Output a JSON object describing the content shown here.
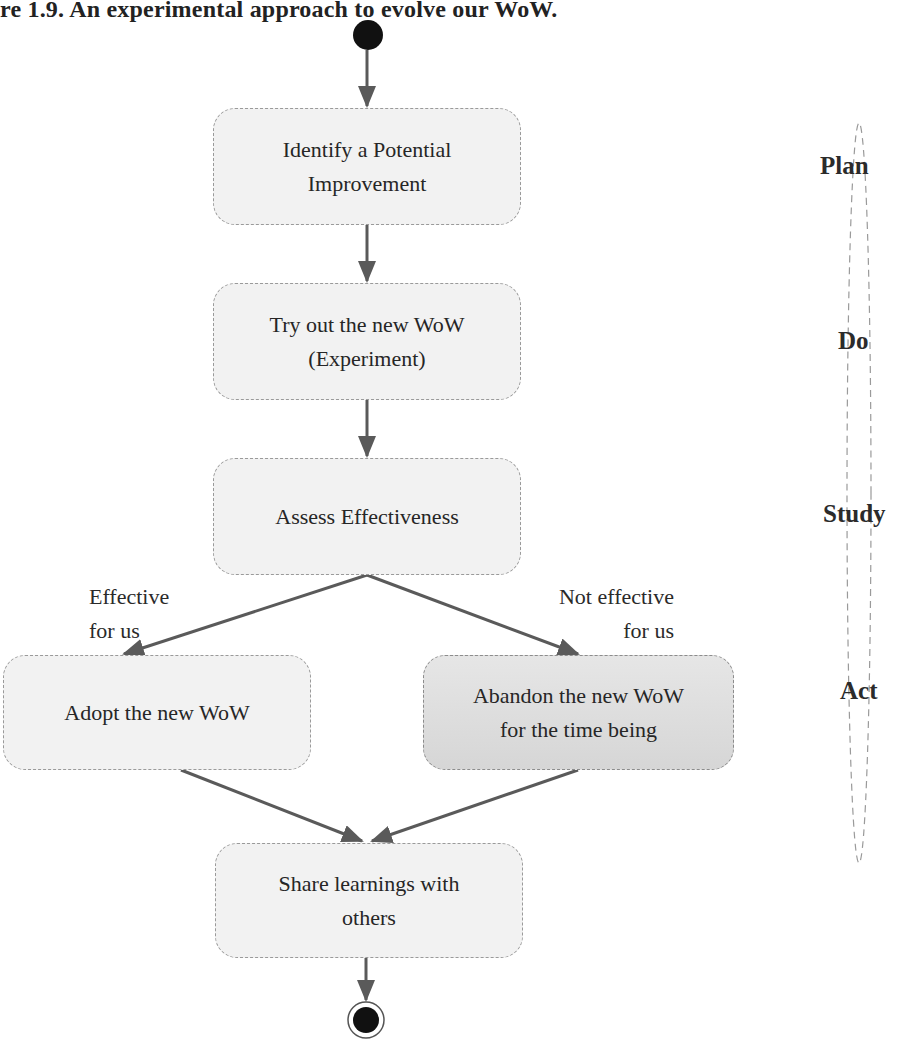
{
  "figure": {
    "title": "re 1.9. An experimental approach to evolve our WoW."
  },
  "nodes": [
    {
      "id": "identify",
      "label": "Identify a Potential\nImprovement"
    },
    {
      "id": "try",
      "label": "Try out the new WoW\n(Experiment)"
    },
    {
      "id": "assess",
      "label": "Assess Effectiveness"
    },
    {
      "id": "adopt",
      "label": "Adopt the new WoW"
    },
    {
      "id": "abandon",
      "label": "Abandon the new WoW\nfor the time being"
    },
    {
      "id": "share",
      "label": "Share learnings with\nothers"
    }
  ],
  "guards": {
    "effective": "Effective\nfor us",
    "not_effective_line1": "Not effective",
    "not_effective_line2": "for us"
  },
  "phases": [
    "Plan",
    "Do",
    "Study",
    "Act"
  ],
  "colors": {
    "node_fill": "#f2f2f2",
    "node_alt_fill": "#d9d9d9",
    "node_border": "#9a9a9a",
    "arrow": "#5a5a5a",
    "start_end": "#111111"
  }
}
